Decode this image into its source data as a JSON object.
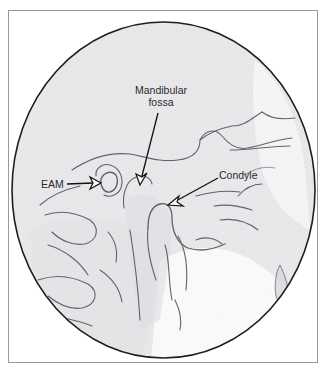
{
  "figure": {
    "type": "annotated lateral radiograph (tracing)",
    "colors": {
      "background": "#ffffff",
      "frame_border": "#9a9a9a",
      "circle_outline": "#1e1e1e",
      "film_tone": "#eeeef0",
      "structure_lines": "#4a4a52",
      "label_text": "#2a2a2a"
    },
    "labels": {
      "mandibular_fossa_line1": "Mandibular",
      "mandibular_fossa_line2": "fossa",
      "eam": "EAM",
      "condyle": "Condyle"
    }
  }
}
